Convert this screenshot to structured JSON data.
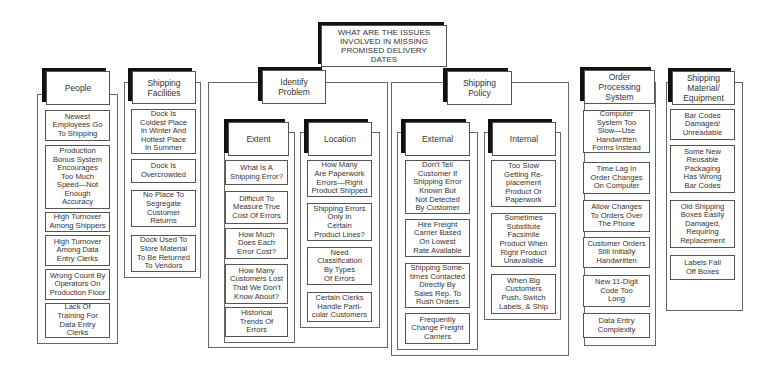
{
  "title": "WHAT ARE THE ISSUES\nINVOLVED IN MISSING\nPROMISED DELIVERY\nDATES",
  "categories": {
    "people": {
      "label": "People",
      "items": [
        "Newest\nEmployees Go\nTo Shipping",
        "Production\nBonus System\nEncourages\nToo Much\nSpeed—Not\nEnough\nAccuracy",
        "High Turnover\nAmong Shippers",
        "High Turnover\nAmong Data\nEntry Clerks",
        "Wrong Count By\nOperators On\nProduction Floor",
        "Lack Of\nTraining For\nData Entry\nClerks"
      ]
    },
    "shipping_facilities": {
      "label": "Shipping\nFacilities",
      "items": [
        "Dock Is\nColdest Place\nIn Winter And\nHottest Place\nIn Summer",
        "Dock Is\nOvercrowded",
        "No Place To\nSegregate\nCustomer\nReturns",
        "Dock Used To\nStore Material\nTo Be Returned\nTo Vendors"
      ]
    },
    "identify_problem": {
      "label": "Identify\nProblem",
      "extent": {
        "label": "Extent",
        "items": [
          "What Is A\nShipping Error?",
          "Difficult To\nMeasure True\nCost Of Errors",
          "How Much\nDoes Each\nError Cost?",
          "How Many\nCustomers Lost\nThat We Don't\nKnow About?",
          "Historical\nTrends Of\nErrors"
        ]
      },
      "location": {
        "label": "Location",
        "items": [
          "How Many\nAre Paperwork\nErrors—Right\nProduct Shipped",
          "Shipping Errors\nOnly In\nCertain\nProduct Lines?",
          "Need\nClassification\nBy Types\nOf Errors",
          "Certain Clerks\nHandle Parti-\ncular Customers"
        ]
      }
    },
    "shipping_policy": {
      "label": "Shipping\nPolicy",
      "external": {
        "label": "External",
        "items": [
          "Don't Tell\nCustomer If\nShipping Error\nKnown But\nNot Detected\nBy Customer",
          "Hire Freight\nCarrier Based\nOn Lowest\nRate Available",
          "Shipping Some-\ntimes Contacted\nDirectly By\nSales Rep. To\nRush Orders",
          "Frequently\nChange Freight\nCarriers"
        ]
      },
      "internal": {
        "label": "Internal",
        "items": [
          "Too Slow\nGetting Re-\nplacement\nProduct Or\nPaperwork",
          "Sometimes\nSubstitute\nFacsimile\nProduct When\nRight Product\nUnavailable",
          "When Big\nCustomers\nPush, Switch\nLabels, & Ship"
        ]
      }
    },
    "order_processing": {
      "label": "Order\nProcessing\nSystem",
      "items": [
        "Computer\nSystem Too\nSlow—Use\nHandwritten\nForms Instead",
        "Time Lag In\nOrder Changes\nOn Computer",
        "Allow Changes\nTo Orders Over\nThe Phone",
        "Customer Orders\nStill Initially\nHandwritten",
        "New 11-Digit\nCode Too\nLong",
        "Data Entry\nComplexity"
      ]
    },
    "shipping_material": {
      "label": "Shipping\nMaterial/\nEquipment",
      "items": [
        "Bar Codes\nDamaged/\nUnreadable",
        "Some New\nReusable\nPackaging\nHas Wrong\nBar Codes",
        "Old Shipping\nBoxes Easily\nDamaged,\nRequiring\nReplacement",
        "Labels Fall\nOff Boxes"
      ]
    }
  },
  "colors": {
    "line": "#555555",
    "shadow": "#111111",
    "background": "#ffffff"
  }
}
